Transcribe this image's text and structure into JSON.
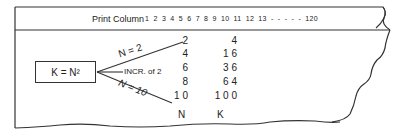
{
  "header": {
    "label": "Print Column",
    "columns": "1 2 3 4 5 6 7 8 9 10 11 12 13 - - - - - 120"
  },
  "formula_box": {
    "text": "K = N²"
  },
  "branches": {
    "upper": "N = 2",
    "middle": "INCR. of 2",
    "lower": "N = 10"
  },
  "table": {
    "n_values": [
      "2",
      "4",
      "6",
      "8",
      "1 0"
    ],
    "k_values": [
      "4",
      "1 6",
      "3 6",
      "6 4",
      "1 0 0"
    ],
    "n_label": "N",
    "k_label": "K"
  }
}
